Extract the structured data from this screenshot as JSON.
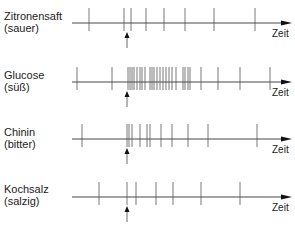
{
  "figure": {
    "time_axis_label": "Zeit",
    "rows": [
      {
        "name": "Zitronensaft",
        "taste": "(sauer)",
        "line_y": 23,
        "label_top": 10,
        "spikes_x": [
          89,
          124,
          131,
          146,
          164,
          185,
          214,
          255
        ],
        "stimulus_x": 127
      },
      {
        "name": "Glucose",
        "taste": "(süß)",
        "line_y": 82,
        "label_top": 69,
        "spikes_x": [
          77,
          112,
          128,
          130,
          132,
          134,
          137,
          140,
          142,
          145,
          150,
          152,
          154,
          157,
          160,
          163,
          166,
          169,
          172,
          176,
          183,
          185,
          188,
          190,
          201,
          218,
          240,
          270
        ],
        "stimulus_x": 127
      },
      {
        "name": "Chinin",
        "taste": "(bitter)",
        "line_y": 139,
        "label_top": 126,
        "spikes_x": [
          82,
          127,
          129,
          132,
          140,
          147,
          150,
          161,
          172,
          188,
          208,
          257
        ],
        "stimulus_x": 127
      },
      {
        "name": "Kochsalz",
        "taste": "(salzig)",
        "line_y": 197,
        "label_top": 183,
        "spikes_x": [
          99,
          127,
          136,
          156,
          173,
          201,
          240
        ],
        "stimulus_x": 127
      }
    ]
  }
}
